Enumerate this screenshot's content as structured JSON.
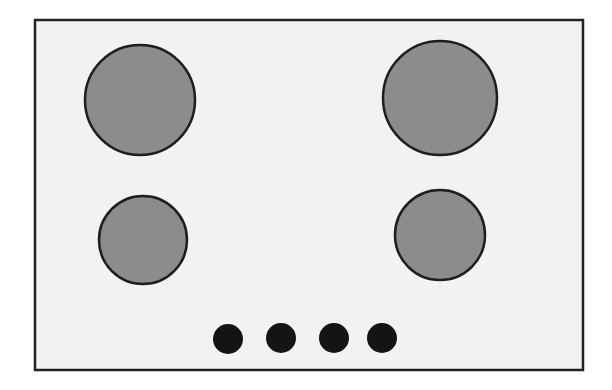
{
  "diagram": {
    "colors": {
      "background": "#ffffff",
      "panel_fill": "#f2f2f2",
      "panel_stroke": "#222222",
      "burner_fill": "#8c8c8c",
      "burner_stroke": "#1e1e1e",
      "knob_fill": "#141414"
    },
    "panel": {
      "x": 35,
      "y": 20,
      "width": 548,
      "height": 350
    },
    "burners": [
      {
        "name": "burner-large-rear-left",
        "cx": 140,
        "cy": 100,
        "r": 55
      },
      {
        "name": "burner-large-rear-right",
        "cx": 440,
        "cy": 98,
        "r": 57
      },
      {
        "name": "burner-small-front-left",
        "cx": 143,
        "cy": 240,
        "r": 44
      },
      {
        "name": "burner-small-front-right",
        "cx": 440,
        "cy": 235,
        "r": 45
      }
    ],
    "knobs": [
      {
        "name": "knob-1",
        "cx": 228,
        "cy": 339,
        "r": 15
      },
      {
        "name": "knob-2",
        "cx": 281,
        "cy": 338,
        "r": 15
      },
      {
        "name": "knob-3",
        "cx": 334,
        "cy": 338,
        "r": 15
      },
      {
        "name": "knob-4",
        "cx": 382,
        "cy": 338,
        "r": 15
      }
    ]
  }
}
